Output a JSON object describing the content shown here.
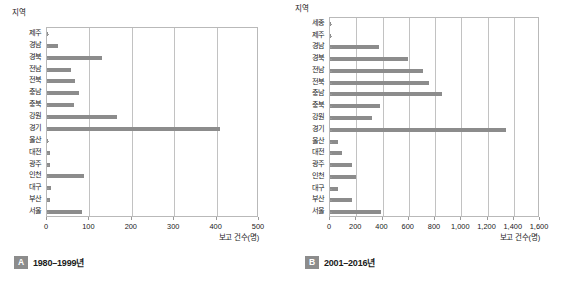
{
  "figure": {
    "background_color": "#ffffff",
    "bar_color": "#8c8c8c",
    "grid_color": "#c2c2c2",
    "frame_color": "#b9b9b9",
    "badge_color": "#8c8c8c"
  },
  "panels": [
    {
      "key": "A",
      "badge": "A",
      "caption": "1980–1999년",
      "y_axis_title": "지역",
      "x_axis_title": "보고 건수(명)"
    },
    {
      "key": "B",
      "badge": "B",
      "caption": "2001–2016년",
      "y_axis_title": "지역",
      "x_axis_title": "보고 건수(명)"
    }
  ],
  "chart_data": [
    {
      "type": "bar",
      "orientation": "horizontal",
      "panel": "A",
      "title": "1980–1999년",
      "xlabel": "보고 건수(명)",
      "ylabel": "지역",
      "xlim": [
        0,
        500
      ],
      "xticks": [
        0,
        100,
        200,
        300,
        400,
        500
      ],
      "xticklabels": [
        "0",
        "100",
        "200",
        "300",
        "400",
        "500"
      ],
      "grid": true,
      "legend": null,
      "categories": [
        "제주",
        "경남",
        "경북",
        "전남",
        "전북",
        "충남",
        "충북",
        "강원",
        "경기",
        "울산",
        "대전",
        "광주",
        "인천",
        "대구",
        "부산",
        "서울"
      ],
      "values": [
        2,
        25,
        130,
        57,
        65,
        75,
        63,
        165,
        408,
        2,
        8,
        8,
        88,
        10,
        6,
        83
      ]
    },
    {
      "type": "bar",
      "orientation": "horizontal",
      "panel": "B",
      "title": "2001–2016년",
      "xlabel": "보고 건수(명)",
      "ylabel": "지역",
      "xlim": [
        0,
        1600
      ],
      "xticks": [
        0,
        200,
        400,
        600,
        800,
        1000,
        1200,
        1400,
        1600
      ],
      "xticklabels": [
        "0",
        "200",
        "400",
        "600",
        "800",
        "1,000",
        "1,200",
        "1,400",
        "1,600"
      ],
      "grid": true,
      "legend": null,
      "categories": [
        "세종",
        "제주",
        "경남",
        "경북",
        "전남",
        "전북",
        "충남",
        "충북",
        "강원",
        "경기",
        "울산",
        "대전",
        "광주",
        "인천",
        "대구",
        "부산",
        "서울"
      ],
      "values": [
        5,
        5,
        370,
        595,
        710,
        755,
        855,
        380,
        320,
        1340,
        60,
        95,
        170,
        200,
        60,
        165,
        385
      ]
    }
  ]
}
